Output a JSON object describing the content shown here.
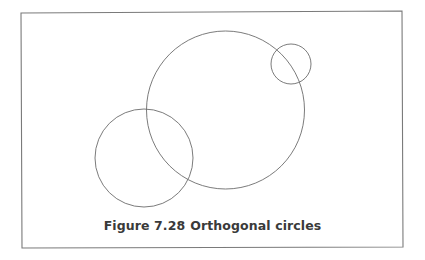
{
  "figure": {
    "number_label": "Figure 7.28",
    "title": "Orthogonal circles",
    "frame": {
      "x1": 21,
      "y1": 12,
      "x2": 403,
      "y2": 247
    },
    "line_color": "#6c6c6c",
    "frame_color": "#7a7a7a",
    "caption_color": "#3a3a3a",
    "circles": [
      {
        "name": "large-circle",
        "cx": 225.5,
        "cy": 110,
        "r": 79
      },
      {
        "name": "small-circle",
        "cx": 291,
        "cy": 64,
        "r": 20
      },
      {
        "name": "lower-left-circle",
        "cx": 144,
        "cy": 158,
        "r": 49
      }
    ]
  }
}
